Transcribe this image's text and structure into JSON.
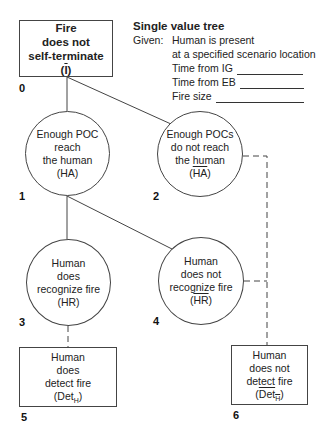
{
  "diagram": {
    "type": "event-tree",
    "info": {
      "title": "Single value tree",
      "given_label": "Given:",
      "given_lines": [
        "Human is present",
        "at a specified scenario location"
      ],
      "fields": [
        {
          "label": "Time from IG",
          "value": ""
        },
        {
          "label": "Time from EB",
          "value": ""
        },
        {
          "label": "Fire size",
          "value": ""
        }
      ]
    },
    "nodes": [
      {
        "id": "0",
        "shape": "box",
        "lines": [
          "Fire",
          "does not",
          "self-terminate"
        ],
        "symbol": "(I)",
        "symbol_base": "I",
        "negated": true,
        "bold": true
      },
      {
        "id": "1",
        "shape": "circle",
        "lines": [
          "Enough POC",
          "reach",
          "the human"
        ],
        "symbol": "(HA)",
        "symbol_base": "HA",
        "negated": false
      },
      {
        "id": "2",
        "shape": "circle",
        "lines": [
          "Enough POCs",
          "do not reach",
          "the human"
        ],
        "symbol": "(HA)",
        "symbol_base": "HA",
        "negated": true
      },
      {
        "id": "3",
        "shape": "circle",
        "lines": [
          "Human",
          "does",
          "recognize fire"
        ],
        "symbol": "(HR)",
        "symbol_base": "HR",
        "negated": false
      },
      {
        "id": "4",
        "shape": "circle",
        "lines": [
          "Human",
          "does not",
          "recognize fire"
        ],
        "symbol": "(HR)",
        "symbol_base": "HR",
        "negated": true
      },
      {
        "id": "5",
        "shape": "box",
        "lines": [
          "Human",
          "does",
          "detect fire"
        ],
        "symbol": "(Det_H)",
        "symbol_base": "Det",
        "symbol_sub": "H",
        "negated": false
      },
      {
        "id": "6",
        "shape": "box",
        "lines": [
          "Human",
          "does not",
          "detect fire"
        ],
        "symbol": "(Det_H)",
        "symbol_base": "Det",
        "symbol_sub": "H",
        "negated": true
      }
    ],
    "edges": [
      {
        "from": "0",
        "to": "1",
        "style": "solid"
      },
      {
        "from": "0",
        "to": "2",
        "style": "solid"
      },
      {
        "from": "1",
        "to": "3",
        "style": "solid"
      },
      {
        "from": "1",
        "to": "4",
        "style": "solid"
      },
      {
        "from": "3",
        "to": "5",
        "style": "dashed"
      },
      {
        "from": "2",
        "to": "6",
        "style": "dashed"
      },
      {
        "from": "4",
        "to": "6",
        "style": "dashed"
      }
    ],
    "colors": {
      "line": "#444444",
      "text": "#222222",
      "background": "#ffffff"
    }
  }
}
